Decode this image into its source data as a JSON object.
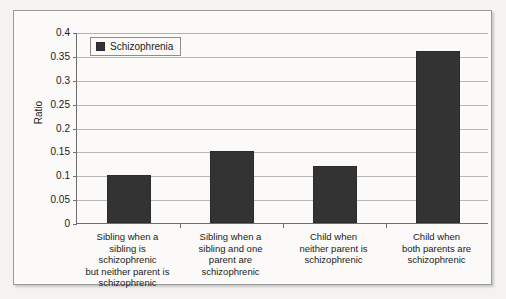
{
  "chart_data": {
    "type": "bar",
    "title": "",
    "subtitle": "",
    "xlabel": "",
    "ylabel": "Ratio",
    "ylim": [
      0,
      0.4
    ],
    "ytick_values": [
      0,
      0.05,
      0.1,
      0.15,
      0.2,
      0.25,
      0.3,
      0.35,
      0.4
    ],
    "ytick_labels": [
      "0",
      "0.05",
      "0.1",
      "0.15",
      "0.2",
      "0.25",
      "0.3",
      "0.35",
      "0.4"
    ],
    "grid": true,
    "legend_position": "top-left",
    "legend": [
      "Schizophrenia"
    ],
    "bar_color": "#333333",
    "categories": [
      "Sibling when a sibling is schizophrenic but neither parent is schizophrenic",
      "Sibling when a sibling and one parent are schizophrenic",
      "Child when neither parent is schizophrenic",
      "Child when both parents are schizophrenic"
    ],
    "category_lines": [
      [
        "Sibling when a",
        "sibling is",
        "schizophrenic",
        "but neither parent is",
        "schizophrenic"
      ],
      [
        "Sibling when a",
        "sibling and one",
        "parent are",
        "schizophrenic"
      ],
      [
        "Child when",
        "neither parent is",
        "schizophrenic"
      ],
      [
        "Child when",
        "both parents are",
        "schizophrenic"
      ]
    ],
    "series": [
      {
        "name": "Schizophrenia",
        "values": [
          0.1,
          0.15,
          0.12,
          0.36
        ]
      }
    ]
  },
  "legend": {
    "swatch_name": "schizophrenia-swatch",
    "label": "Schizophrenia"
  },
  "axis": {
    "y_title": "Ratio"
  }
}
